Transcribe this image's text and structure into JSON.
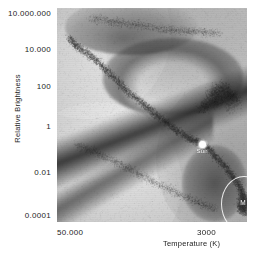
{
  "chart_data": {
    "type": "scatter",
    "title": "",
    "subtitle": "",
    "xlabel": "Temperature (K)",
    "ylabel": "Relative Brightness",
    "xticks": [
      "50.000",
      "3000"
    ],
    "xtick_values": [
      50000,
      3000
    ],
    "yticks": [
      "10.000.000",
      "10.000",
      "100",
      "1",
      "0.01",
      "0.0001"
    ],
    "ytick_values": [
      10000000,
      10000,
      100,
      1,
      0.01,
      0.0001
    ],
    "xlim": [
      50000,
      3000
    ],
    "ylim": [
      0.0001,
      10000000
    ],
    "xscale": "log-reversed",
    "yscale": "log",
    "grid": false,
    "legend": "none",
    "annotations": [
      {
        "name": "sun",
        "label": "Sun",
        "marker": "white-filled-circle",
        "x": 5800,
        "y": 1,
        "color": "#fdfdfd"
      },
      {
        "name": "m-dwarf-region",
        "label": "M",
        "marker": "ellipse-outline",
        "x": 3200,
        "y": 0.001,
        "color": "#fafafa"
      }
    ],
    "series": [
      {
        "name": "Main sequence",
        "description": "Dominant diagonal band running from hot/bright upper-left to cool/faint lower-right",
        "points": [
          [
            42000,
            300000
          ],
          [
            38000,
            120000
          ],
          [
            33000,
            60000
          ],
          [
            28000,
            20000
          ],
          [
            24000,
            6000
          ],
          [
            20000,
            1500
          ],
          [
            17000,
            400
          ],
          [
            14000,
            120
          ],
          [
            12000,
            40
          ],
          [
            10000,
            14
          ],
          [
            8500,
            5
          ],
          [
            7200,
            2.2
          ],
          [
            6400,
            1.5
          ],
          [
            5800,
            1
          ],
          [
            5200,
            0.5
          ],
          [
            4600,
            0.16
          ],
          [
            4100,
            0.06
          ],
          [
            3700,
            0.02
          ],
          [
            3400,
            0.008
          ],
          [
            3200,
            0.003
          ],
          [
            3050,
            0.001
          ]
        ]
      },
      {
        "name": "Giants",
        "description": "Dense clump in upper right, roughly 10 to 10.000 relative brightness, 3000-6000 K",
        "points": [
          [
            6000,
            60
          ],
          [
            5400,
            120
          ],
          [
            4900,
            200
          ],
          [
            4500,
            350
          ],
          [
            4100,
            500
          ],
          [
            3800,
            300
          ],
          [
            3500,
            150
          ],
          [
            4200,
            900
          ],
          [
            4700,
            700
          ],
          [
            5100,
            400
          ],
          [
            3600,
            60
          ]
        ]
      },
      {
        "name": "White dwarfs",
        "description": "Faint lower band running parallel below the main sequence",
        "points": [
          [
            38000,
            0.9
          ],
          [
            30000,
            0.5
          ],
          [
            24000,
            0.2
          ],
          [
            19000,
            0.08
          ],
          [
            15000,
            0.03
          ],
          [
            12000,
            0.012
          ],
          [
            9500,
            0.005
          ],
          [
            7500,
            0.002
          ],
          [
            6000,
            0.0009
          ],
          [
            4800,
            0.0005
          ]
        ]
      },
      {
        "name": "Supergiants",
        "description": "Sparse scattered band across the top of the diagram",
        "points": [
          [
            30000,
            3000000
          ],
          [
            22000,
            2000000
          ],
          [
            16000,
            1500000
          ],
          [
            11000,
            900000
          ],
          [
            8000,
            700000
          ],
          [
            6000,
            600000
          ],
          [
            4500,
            500000
          ]
        ]
      },
      {
        "name": "M dwarfs",
        "description": "Dense clump at the cool faint end, circled and labelled M",
        "points": [
          [
            3300,
            0.002
          ],
          [
            3200,
            0.0015
          ],
          [
            3100,
            0.0008
          ],
          [
            3250,
            0.0006
          ],
          [
            3150,
            0.0004
          ],
          [
            3350,
            0.0009
          ],
          [
            3050,
            0.0003
          ]
        ]
      }
    ],
    "colors": {
      "background": "#b9b9b9",
      "stars": "#282828",
      "annotation": "#fafafa",
      "text": "#1d1d1d"
    }
  },
  "axes": {
    "y": {
      "label": "Relative Brightness",
      "ticks": [
        {
          "text": "10.000.000",
          "top": 9
        },
        {
          "text": "10.000",
          "top": 45
        },
        {
          "text": "100",
          "top": 82
        },
        {
          "text": "1",
          "top": 122
        },
        {
          "text": "0.01",
          "top": 168
        },
        {
          "text": "0.0001",
          "top": 211
        }
      ]
    },
    "x": {
      "label": "Temperature (K)",
      "ticks": [
        {
          "text": "50.000",
          "left": 57
        },
        {
          "text": "3000",
          "left": 196
        }
      ]
    }
  },
  "markers": {
    "sun": {
      "label": "Sun"
    },
    "m_region": {
      "label": "M"
    }
  }
}
